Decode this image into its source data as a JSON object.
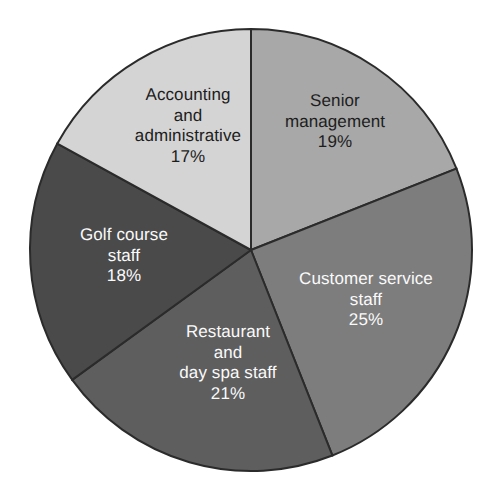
{
  "chart_data": {
    "type": "pie",
    "title": "",
    "subtitle": "",
    "xlabel": "",
    "ylabel": "",
    "grid": false,
    "legend_position": "none",
    "labels_inside_slices": true,
    "total_percent": 100,
    "start_angle_deg": 0,
    "direction": "clockwise",
    "categories": [
      "Senior management",
      "Customer service staff",
      "Restaurant and day spa staff",
      "Golf course staff",
      "Accounting and administrative"
    ],
    "values": [
      19,
      25,
      21,
      18,
      17
    ],
    "slices": [
      {
        "name": "Senior management",
        "name_lines": [
          "Senior",
          "management"
        ],
        "value": 19,
        "value_label": "19%",
        "color": "#a8a8a8",
        "text_color": "#1d1d1d",
        "text_style": "dark",
        "label_x": 335,
        "label_y": 122
      },
      {
        "name": "Customer service staff",
        "name_lines": [
          "Customer service",
          "staff"
        ],
        "value": 25,
        "value_label": "25%",
        "color": "#7d7d7d",
        "text_color": "#fafafa",
        "text_style": "light",
        "label_x": 366,
        "label_y": 300
      },
      {
        "name": "Restaurant and day spa staff",
        "name_lines": [
          "Restaurant",
          "and",
          "day spa staff"
        ],
        "value": 21,
        "value_label": "21%",
        "color": "#5e5e5e",
        "text_color": "#fafafa",
        "text_style": "light",
        "label_x": 228,
        "label_y": 363
      },
      {
        "name": "Golf course staff",
        "name_lines": [
          "Golf course",
          "staff"
        ],
        "value": 18,
        "value_label": "18%",
        "color": "#4a4a4a",
        "text_color": "#fafafa",
        "text_style": "light",
        "label_x": 124,
        "label_y": 256
      },
      {
        "name": "Accounting and administrative",
        "name_lines": [
          "Accounting",
          "and",
          "administrative"
        ],
        "value": 17,
        "value_label": "17%",
        "color": "#d4d4d4",
        "text_color": "#1d1d1d",
        "text_style": "dark",
        "label_x": 188,
        "label_y": 126
      }
    ],
    "geometry": {
      "center_x": 251,
      "center_y": 250,
      "radius": 221,
      "outline_color": "#2b2b2b",
      "background": "#ffffff"
    }
  }
}
